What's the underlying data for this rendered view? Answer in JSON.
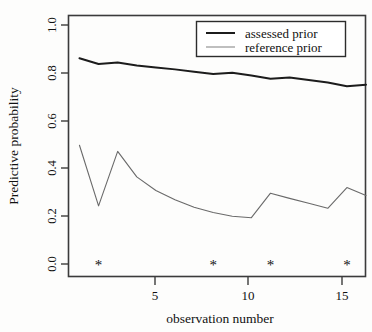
{
  "chart_data": {
    "type": "line",
    "title": "",
    "xlabel": "observation number",
    "ylabel": "Predictive probability",
    "xlim": [
      0.4,
      16.0
    ],
    "ylim": [
      -0.03,
      1.03
    ],
    "grid": false,
    "legend_position": "top-right",
    "x_ticks": [
      5,
      10,
      15
    ],
    "x_tick_labels": [
      "5",
      "10",
      "15"
    ],
    "y_ticks": [
      0.0,
      0.2,
      0.4,
      0.6,
      0.8,
      1.0
    ],
    "y_tick_labels": [
      "0.0",
      "0.2",
      "0.4",
      "0.6",
      "0.8",
      "1.0"
    ],
    "x": [
      1,
      2,
      3,
      4,
      5,
      6,
      7,
      8,
      9,
      10,
      11,
      12,
      13,
      14,
      15,
      16
    ],
    "series": [
      {
        "name": "assessed prior",
        "color": "#1c1c1c",
        "values": [
          0.855,
          0.832,
          0.838,
          0.826,
          0.818,
          0.81,
          0.8,
          0.791,
          0.796,
          0.785,
          0.772,
          0.777,
          0.767,
          0.757,
          0.742,
          0.748
        ]
      },
      {
        "name": "reference prior",
        "color": "#6a6a6a",
        "values": [
          0.503,
          0.258,
          0.478,
          0.375,
          0.32,
          0.283,
          0.252,
          0.231,
          0.216,
          0.21,
          0.309,
          0.288,
          0.268,
          0.248,
          0.332,
          0.3
        ]
      }
    ],
    "annotations": {
      "marker_symbol": "*",
      "marker_label": "flagged observation",
      "marker_y": 0.015,
      "marker_x": [
        2,
        8,
        11,
        15
      ]
    }
  },
  "legend": {
    "entries": [
      {
        "label": "assessed prior"
      },
      {
        "label": "reference prior"
      }
    ]
  },
  "colors": {
    "assessed": "#1c1c1c",
    "reference": "#6a6a6a",
    "frame": "#3b3b3b",
    "background": "#fdfdfc"
  }
}
